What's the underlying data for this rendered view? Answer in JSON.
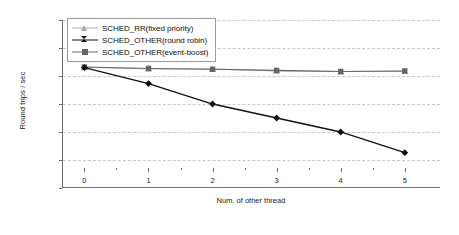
{
  "chart_data": {
    "type": "line",
    "title": "",
    "xlabel": "Num. of other thread",
    "ylabel": "Round trips / sec",
    "x": [
      0,
      1,
      2,
      3,
      4,
      5
    ],
    "xtick_labels": [
      "0",
      "1",
      "2",
      "3",
      "4",
      "5"
    ],
    "xlim": [
      -0.35,
      5.55
    ],
    "ylim": [
      50,
      110
    ],
    "ytick_labels": [
      "50",
      "60",
      "70",
      "80",
      "90",
      "100",
      "110"
    ],
    "yticks": [
      50,
      60,
      70,
      80,
      90,
      100,
      110
    ],
    "grid": "horizontal-dashed",
    "legend_position": "top-left-inside",
    "series": [
      {
        "name": "SCHED_RR(fixed priority)",
        "values": [
          93.1,
          92.6,
          92.5,
          91.8,
          91.6,
          91.7
        ],
        "color": "#a9a9a9",
        "marker": "triangle"
      },
      {
        "name": "SCHED_OTHER(round robin)",
        "values": [
          93.0,
          87.3,
          80.0,
          75.0,
          70.0,
          62.6
        ],
        "color": "#111111",
        "marker": "diamond"
      },
      {
        "name": "SCHED_OTHER(event-boost)",
        "values": [
          93.2,
          92.7,
          92.4,
          92.0,
          91.6,
          91.8
        ],
        "color": "#666666",
        "marker": "square"
      }
    ]
  },
  "axes": {
    "axis_line_color": "#6e6e6e",
    "gridline_color": "#c8c8c8"
  }
}
